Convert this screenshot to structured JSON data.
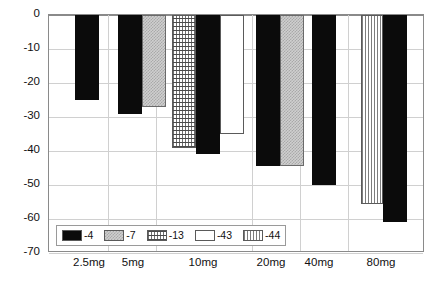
{
  "chart_data": {
    "type": "bar",
    "title": "",
    "subtitle": "",
    "xlabel": "",
    "ylabel": "",
    "categories": [
      "2.5mg",
      "5mg",
      "10mg",
      "20mg",
      "40mg",
      "80mg"
    ],
    "ylim": [
      -70,
      0
    ],
    "yticks": [
      0,
      -10,
      -20,
      -30,
      -40,
      -50,
      -60,
      -70
    ],
    "ytick_labels": [
      "0",
      "-10",
      "-20",
      "-30",
      "-40",
      "-50",
      "-60",
      "-70"
    ],
    "grid": true,
    "legend_position": "inside-bottom-left",
    "series": [
      {
        "name": "-4",
        "pattern": "solid-black",
        "color": "#0b0b0b",
        "values": [
          -25,
          -29,
          -41,
          -44.5,
          -50,
          -61
        ]
      },
      {
        "name": "-7",
        "pattern": "gray-checker",
        "color": "#cfcfcf",
        "values": [
          null,
          -27,
          null,
          -44.5,
          null,
          null
        ]
      },
      {
        "name": "-13",
        "pattern": "fine-dots",
        "color": "#ffffff",
        "values": [
          null,
          null,
          -39,
          null,
          null,
          null
        ]
      },
      {
        "name": "-43",
        "pattern": "empty-white",
        "color": "#ffffff",
        "values": [
          null,
          null,
          -35,
          null,
          null,
          null
        ]
      },
      {
        "name": "-44",
        "pattern": "vertical-lines",
        "color": "#ffffff",
        "values": [
          null,
          null,
          null,
          null,
          null,
          -55.5
        ]
      }
    ],
    "bars": [
      {
        "category": "2.5mg",
        "series": "-4",
        "value": -25,
        "pattern": "solid-black",
        "x": 74,
        "width": 24
      },
      {
        "category": "5mg",
        "series": "-4",
        "value": -29,
        "pattern": "solid-black",
        "x": 117,
        "width": 24
      },
      {
        "category": "5mg",
        "series": "-7",
        "value": -27,
        "pattern": "gray-checker",
        "x": 141,
        "width": 24
      },
      {
        "category": "10mg",
        "series": "-13",
        "value": -39,
        "pattern": "fine-dots",
        "x": 171,
        "width": 24
      },
      {
        "category": "10mg",
        "series": "-4",
        "value": -41,
        "pattern": "solid-black",
        "x": 195,
        "width": 24
      },
      {
        "category": "10mg",
        "series": "-43",
        "value": -35,
        "pattern": "empty-white",
        "x": 219,
        "width": 24
      },
      {
        "category": "20mg",
        "series": "-4",
        "value": -44.5,
        "pattern": "solid-black",
        "x": 255,
        "width": 24
      },
      {
        "category": "20mg",
        "series": "-7",
        "value": -44.5,
        "pattern": "gray-checker",
        "x": 279,
        "width": 24
      },
      {
        "category": "40mg",
        "series": "-4",
        "value": -50,
        "pattern": "solid-black",
        "x": 311,
        "width": 24
      },
      {
        "category": "80mg",
        "series": "-44",
        "value": -55.5,
        "pattern": "vertical-lines",
        "x": 360,
        "width": 22
      },
      {
        "category": "80mg",
        "series": "-4",
        "value": -61,
        "pattern": "solid-black",
        "x": 382,
        "width": 24
      }
    ],
    "category_centers": [
      89,
      133,
      203,
      271,
      319,
      381
    ],
    "category_separators": [
      107,
      155,
      251,
      299,
      347
    ]
  },
  "legend": {
    "items": [
      {
        "label": "-4",
        "pattern": "solid-black"
      },
      {
        "label": "-7",
        "pattern": "gray-checker"
      },
      {
        "label": "-13",
        "pattern": "fine-dots"
      },
      {
        "label": "-43",
        "pattern": "empty-white"
      },
      {
        "label": "-44",
        "pattern": "vertical-lines"
      }
    ]
  },
  "colors": {
    "background": "#ffffff",
    "axis": "#8a8a8a",
    "grid": "#d0d0d0",
    "text": "#111111",
    "bar_black": "#0b0b0b",
    "bar_gray": "#cfcfcf"
  }
}
